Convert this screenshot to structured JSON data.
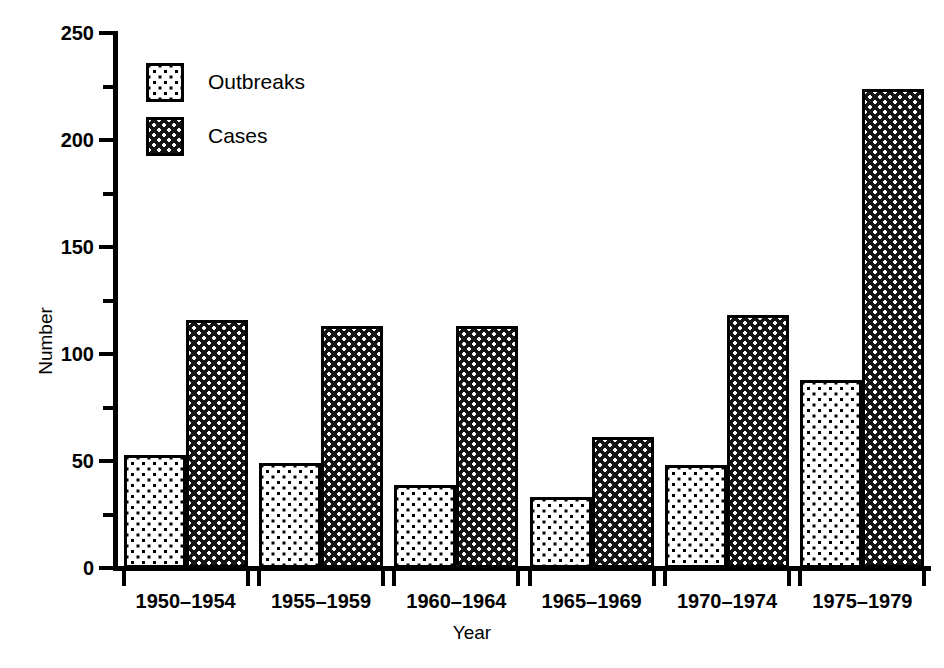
{
  "chart_data": {
    "type": "bar",
    "title": "",
    "xlabel": "Year",
    "ylabel": "Number",
    "categories": [
      "1950–1954",
      "1955–1959",
      "1960–1964",
      "1965–1969",
      "1970–1974",
      "1975–1979"
    ],
    "series": [
      {
        "name": "Outbreaks",
        "values": [
          53,
          49,
          39,
          33,
          48,
          88
        ],
        "fill": "light-dotted",
        "color": "#ffffff"
      },
      {
        "name": "Cases",
        "values": [
          116,
          113,
          113,
          61,
          118,
          224
        ],
        "fill": "dark-dotted",
        "color": "#151515"
      }
    ],
    "ylim": [
      0,
      250
    ],
    "yticks_major": [
      0,
      50,
      100,
      150,
      200,
      250
    ],
    "yticks_minor": [
      25,
      75,
      125,
      175,
      225
    ],
    "ytick_labels": [
      "0",
      "50",
      "100",
      "150",
      "200",
      "250"
    ],
    "grid": false,
    "legend_position": "upper-left-inside"
  },
  "legend": {
    "entries": [
      {
        "label": "Outbreaks",
        "swatch": "light-dotted-swatch"
      },
      {
        "label": "Cases",
        "swatch": "dark-dotted-swatch"
      }
    ]
  },
  "axes": {
    "y_title": "Number",
    "x_title": "Year"
  }
}
